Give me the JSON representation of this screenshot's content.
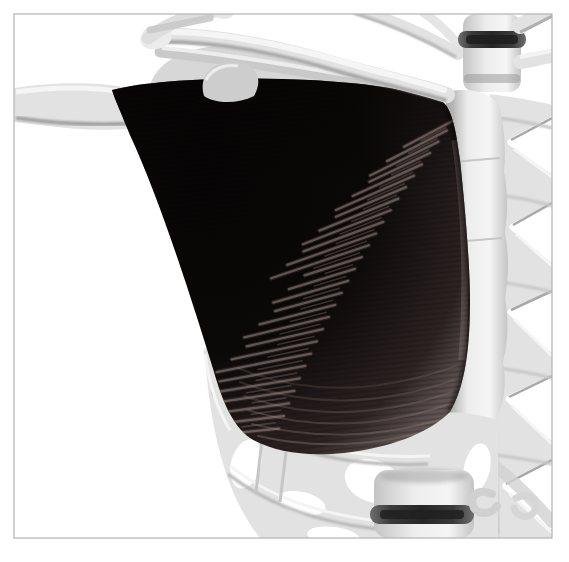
{
  "meta": {
    "type": "3d-medical-render"
  },
  "scene": {
    "background": "#ffffff",
    "frame_border": "#b3b3b3",
    "colors": {
      "background": "#ffffff",
      "frame_border": "#b3b3b3",
      "muscle_core": "#060404",
      "muscle_dark": "#0b0808",
      "muscle_mid": "#2c2423",
      "muscle_light": "#5d5251",
      "muscle_edge": "#6e6261",
      "fiber_highlight": "#98867f",
      "bone_light": "#f5f5f5",
      "bone_base": "#e2e2e2",
      "bone_mid": "#c4c4c4",
      "bone_shadow": "#a2a2a2",
      "bone_crevice": "#8c8c8c",
      "disc_dark": "#262626",
      "disc_edge": "#6e6e6e"
    },
    "structures": [
      {
        "id": "pectoralis-major-muscle"
      },
      {
        "id": "humerus-bone"
      },
      {
        "id": "clavicle-bone"
      },
      {
        "id": "scapula-bone"
      },
      {
        "id": "sternum-bone"
      },
      {
        "id": "rib-cage"
      },
      {
        "id": "thoracic-vertebra"
      },
      {
        "id": "lumbar-vertebra"
      },
      {
        "id": "intervertebral-disc"
      }
    ],
    "striations": {
      "count": 27
    }
  }
}
